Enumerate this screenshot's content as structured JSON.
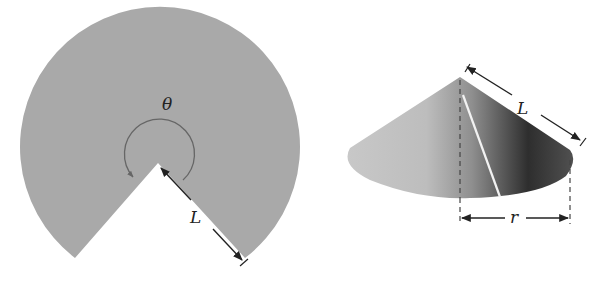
{
  "figure": {
    "left_panel": {
      "description": "Flat circular sector (disk with wedge removed)",
      "angle_label": "θ",
      "radius_label": "L"
    },
    "right_panel": {
      "description": "Cone formed by joining sector edges",
      "slant_label": "L",
      "radius_label": "r"
    },
    "colors": {
      "sector_fill": "#a9a9a9",
      "outline": "#555555",
      "arrow": "#222222"
    }
  }
}
